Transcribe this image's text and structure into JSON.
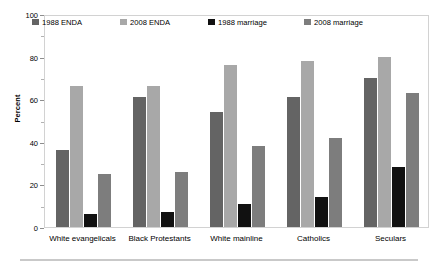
{
  "chart_data": {
    "type": "bar",
    "title": "",
    "xlabel": "",
    "ylabel": "Percent",
    "ylim": [
      0,
      100
    ],
    "yticks": [
      0,
      20,
      40,
      60,
      80,
      100
    ],
    "yminorticks": [
      10,
      30,
      50,
      70,
      90
    ],
    "grid": false,
    "legend_position": "top-inside",
    "categories": [
      "White evangelicals",
      "Black Protestants",
      "White mainline",
      "Catholics",
      "Seculars"
    ],
    "series": [
      {
        "name": "1988 ENDA",
        "color": "#646464",
        "values": [
          36,
          61,
          54,
          61,
          70
        ]
      },
      {
        "name": "2008 ENDA",
        "color": "#a8a8a8",
        "values": [
          66,
          66,
          76,
          78,
          80
        ]
      },
      {
        "name": "1988 marriage",
        "color": "#111111",
        "values": [
          6,
          7,
          11,
          14,
          28
        ]
      },
      {
        "name": "2008 marriage",
        "color": "#7d7d7d",
        "values": [
          25,
          26,
          38,
          42,
          63
        ]
      }
    ]
  }
}
